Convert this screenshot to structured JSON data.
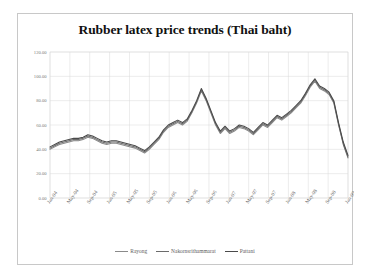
{
  "figure": {
    "title": "Rubber latex price trends (Thai baht)",
    "border_color": "#c8c8c8",
    "background": "#ffffff"
  },
  "axes": {
    "grid_color": "#d9d9d9",
    "tick_label_color": "#7a7a7a",
    "y_ticks": [
      "0.00",
      "20.00",
      "40.00",
      "60.00",
      "80.00",
      "100.00",
      "120.00"
    ],
    "x_ticks": [
      "Jan-04",
      "May-04",
      "Sep-04",
      "Jan-05",
      "May-05",
      "Sep-05",
      "Jan-06",
      "May-06",
      "Sep-06",
      "Jan-07",
      "May-07",
      "Sep-07",
      "Jan-08",
      "May-08",
      "Sep-08",
      "Jan-09"
    ]
  },
  "legend": {
    "items": [
      {
        "label": "Rayong",
        "color": "#8a8a8a"
      },
      {
        "label": "Nakornsrithammarat",
        "color": "#6b6b6b"
      },
      {
        "label": "Pattani",
        "color": "#4a4a4a"
      }
    ]
  },
  "chart_data": {
    "type": "line",
    "title": "Rubber latex price trends (Thai baht)",
    "xlabel": "",
    "ylabel": "",
    "ylim": [
      0,
      120
    ],
    "ytick_step": 20,
    "grid": true,
    "legend_position": "bottom",
    "x": [
      "Jan-04",
      "Feb-04",
      "Mar-04",
      "Apr-04",
      "May-04",
      "Jun-04",
      "Jul-04",
      "Aug-04",
      "Sep-04",
      "Oct-04",
      "Nov-04",
      "Dec-04",
      "Jan-05",
      "Feb-05",
      "Mar-05",
      "Apr-05",
      "May-05",
      "Jun-05",
      "Jul-05",
      "Aug-05",
      "Sep-05",
      "Oct-05",
      "Nov-05",
      "Dec-05",
      "Jan-06",
      "Feb-06",
      "Mar-06",
      "Apr-06",
      "May-06",
      "Jun-06",
      "Jul-06",
      "Aug-06",
      "Sep-06",
      "Oct-06",
      "Nov-06",
      "Dec-06",
      "Jan-07",
      "Feb-07",
      "Mar-07",
      "Apr-07",
      "May-07",
      "Jun-07",
      "Jul-07",
      "Aug-07",
      "Sep-07",
      "Oct-07",
      "Nov-07",
      "Dec-07",
      "Jan-08",
      "Feb-08",
      "Mar-08",
      "Apr-08",
      "May-08",
      "Jun-08",
      "Jul-08",
      "Aug-08",
      "Sep-08",
      "Oct-08",
      "Nov-08",
      "Dec-08",
      "Jan-09",
      "Feb-09",
      "Mar-09",
      "Apr-09"
    ],
    "series": [
      {
        "name": "Rayong",
        "color": "#8a8a8a",
        "values": [
          40,
          42,
          44,
          45,
          46,
          47,
          47,
          48,
          50,
          49,
          47,
          45,
          44,
          45,
          45,
          44,
          43,
          42,
          41,
          39,
          37,
          40,
          44,
          48,
          54,
          58,
          60,
          62,
          60,
          63,
          70,
          78,
          88,
          80,
          70,
          60,
          53,
          57,
          53,
          55,
          58,
          57,
          55,
          52,
          56,
          60,
          58,
          62,
          66,
          64,
          67,
          70,
          74,
          78,
          84,
          91,
          96,
          90,
          88,
          85,
          78,
          60,
          45,
          34
        ]
      },
      {
        "name": "Nakornsrithammarat",
        "color": "#6b6b6b",
        "values": [
          41,
          43,
          45,
          46,
          47,
          48,
          48,
          49,
          51,
          50,
          48,
          46,
          45,
          46,
          46,
          45,
          44,
          43,
          42,
          40,
          38,
          41,
          45,
          49,
          55,
          59,
          61,
          63,
          61,
          64,
          71,
          79,
          89,
          81,
          71,
          61,
          54,
          58,
          54,
          56,
          59,
          58,
          56,
          53,
          57,
          61,
          59,
          63,
          67,
          65,
          68,
          71,
          75,
          79,
          85,
          92,
          97,
          91,
          89,
          86,
          79,
          61,
          44,
          33
        ]
      },
      {
        "name": "Pattani",
        "color": "#4a4a4a",
        "values": [
          42,
          44,
          46,
          47,
          48,
          49,
          49,
          50,
          52,
          51,
          49,
          47,
          46,
          47,
          47,
          46,
          45,
          44,
          43,
          41,
          39,
          42,
          46,
          50,
          56,
          60,
          62,
          64,
          62,
          65,
          72,
          80,
          90,
          82,
          72,
          62,
          55,
          59,
          55,
          57,
          60,
          59,
          57,
          54,
          58,
          62,
          60,
          64,
          68,
          66,
          69,
          72,
          76,
          80,
          86,
          93,
          98,
          92,
          90,
          87,
          80,
          62,
          46,
          35
        ]
      }
    ],
    "annotations": [
      {
        "text": "Mid-2006 spike near 90",
        "x": "Sep-06"
      },
      {
        "text": "Peak near 98 in Sep-08",
        "x": "Sep-08"
      },
      {
        "text": "Sharp collapse to ~34 by Apr-09",
        "x": "Apr-09"
      }
    ]
  }
}
